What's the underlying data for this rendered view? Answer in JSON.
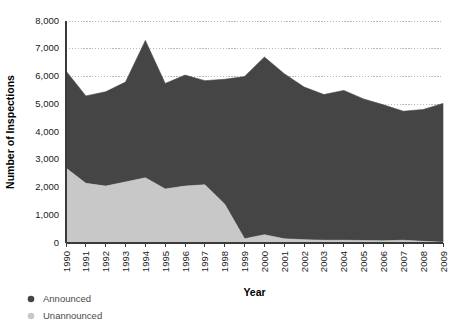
{
  "chart_data": {
    "type": "area",
    "stacked": true,
    "title": "",
    "xlabel": "Year",
    "ylabel": "Number of Inspections",
    "categories": [
      "1990",
      "1991",
      "1992",
      "1993",
      "1994",
      "1995",
      "1996",
      "1997",
      "1998",
      "1999",
      "2000",
      "2001",
      "2002",
      "2003",
      "2004",
      "2005",
      "2006",
      "2007",
      "2008",
      "2009"
    ],
    "x": [
      1990,
      1991,
      1992,
      1993,
      1994,
      1995,
      1996,
      1997,
      1998,
      1999,
      2000,
      2001,
      2002,
      2003,
      2004,
      2005,
      2006,
      2007,
      2008,
      2009
    ],
    "series": [
      {
        "name": "Announced",
        "color": "#454545",
        "values": [
          3500,
          3150,
          3400,
          3600,
          4950,
          3800,
          4000,
          3750,
          4500,
          5850,
          6400,
          5950,
          5500,
          5250,
          5400,
          5100,
          4900,
          4650,
          4750,
          5000
        ]
      },
      {
        "name": "Unannounced",
        "color": "#c8c8c8",
        "values": [
          2700,
          2150,
          2050,
          2200,
          2350,
          1950,
          2050,
          2100,
          1400,
          150,
          300,
          150,
          120,
          100,
          100,
          90,
          80,
          100,
          60,
          30
        ]
      }
    ],
    "totals": [
      6200,
      5300,
      5450,
      5800,
      7300,
      5750,
      6050,
      5850,
      5900,
      6000,
      6700,
      6100,
      5620,
      5350,
      5500,
      5190,
      4980,
      4750,
      4810,
      5030
    ],
    "ylim": [
      0,
      8000
    ],
    "ytick_values": [
      0,
      1000,
      2000,
      3000,
      4000,
      5000,
      6000,
      7000,
      8000
    ],
    "ytick_labels": [
      "0",
      "1,000",
      "2,000",
      "3,000",
      "4,000",
      "5,000",
      "6,000",
      "7,000",
      "8,000"
    ],
    "grid": true,
    "grid_axis": "y",
    "legend_position": "bottom-left",
    "legend": [
      {
        "label": "Announced",
        "color": "#454545",
        "marker": "circle"
      },
      {
        "label": "Unannounced",
        "color": "#c8c8c8",
        "marker": "circle"
      }
    ]
  },
  "axes": {
    "y_title": "Number of Inspections",
    "x_title": "Year"
  },
  "colors": {
    "announced": "#454545",
    "unannounced": "#c8c8c8",
    "axis": "#3a3a3a",
    "grid": "#9a9a9a",
    "background": "#ffffff"
  }
}
